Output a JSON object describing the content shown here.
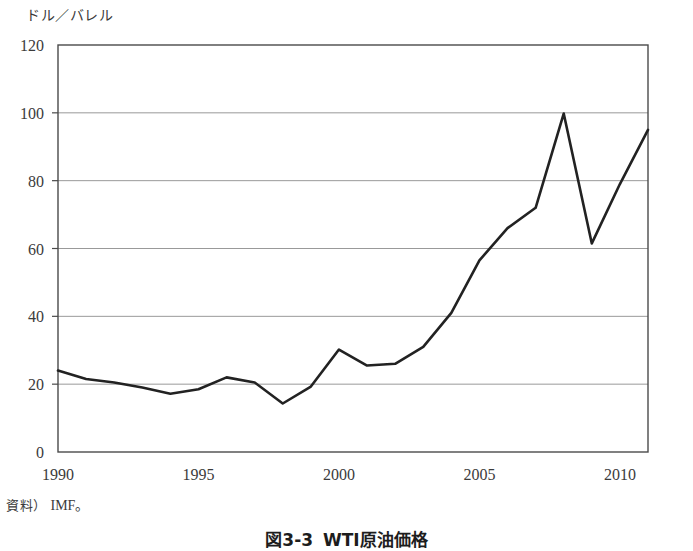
{
  "figure": {
    "y_unit_label": "ドル／バレル",
    "source_label": "資料）",
    "source_value": "IMF。",
    "caption_number": "図3-3",
    "caption_title": "WTI原油価格"
  },
  "chart_data": {
    "type": "line",
    "title": "WTI原油価格",
    "xlabel": "",
    "ylabel": "ドル／バレル",
    "ylim": [
      0,
      120
    ],
    "xlim": [
      1990,
      2011
    ],
    "yticks": [
      0,
      20,
      40,
      60,
      80,
      100,
      120
    ],
    "ytick_labels": [
      "0",
      "20",
      "40",
      "60",
      "80",
      "100",
      "120"
    ],
    "xticks": [
      1990,
      1995,
      2000,
      2005,
      2010
    ],
    "xtick_labels": [
      "1990",
      "1995",
      "2000",
      "2005",
      "2010"
    ],
    "grid": "horizontal",
    "legend": "none",
    "line_color": "#222222",
    "line_width": 2.6,
    "x": [
      1990,
      1991,
      1992,
      1993,
      1994,
      1995,
      1996,
      1997,
      1998,
      1999,
      2000,
      2001,
      2002,
      2003,
      2004,
      2005,
      2006,
      2007,
      2008,
      2009,
      2010,
      2011
    ],
    "values": [
      24,
      21.5,
      20.5,
      19,
      17.2,
      18.5,
      22,
      20.5,
      14.3,
      19.3,
      30.2,
      25.5,
      26,
      31,
      41,
      56.5,
      66,
      72,
      99.8,
      61.5,
      79,
      95
    ],
    "series": [
      {
        "name": "WTI原油価格",
        "values": [
          24,
          21.5,
          20.5,
          19,
          17.2,
          18.5,
          22,
          20.5,
          14.3,
          19.3,
          30.2,
          25.5,
          26,
          31,
          41,
          56.5,
          66,
          72,
          99.8,
          61.5,
          79,
          95
        ]
      }
    ]
  }
}
